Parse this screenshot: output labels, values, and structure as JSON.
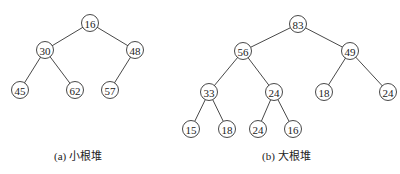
{
  "figure": {
    "left": {
      "caption": "(a) 小根堆",
      "nodes": [
        {
          "id": "a0",
          "value": "16",
          "x": 90,
          "y": 23
        },
        {
          "id": "a1",
          "value": "30",
          "x": 45,
          "y": 50
        },
        {
          "id": "a2",
          "value": "48",
          "x": 135,
          "y": 50
        },
        {
          "id": "a3",
          "value": "45",
          "x": 20,
          "y": 90
        },
        {
          "id": "a4",
          "value": "62",
          "x": 75,
          "y": 90
        },
        {
          "id": "a5",
          "value": "57",
          "x": 110,
          "y": 90
        }
      ],
      "edges": [
        [
          "a0",
          "a1"
        ],
        [
          "a0",
          "a2"
        ],
        [
          "a1",
          "a3"
        ],
        [
          "a1",
          "a4"
        ],
        [
          "a2",
          "a5"
        ]
      ]
    },
    "right": {
      "caption": "(b) 大根堆",
      "nodes": [
        {
          "id": "b0",
          "value": "83",
          "x": 298,
          "y": 24
        },
        {
          "id": "b1",
          "value": "56",
          "x": 243,
          "y": 51
        },
        {
          "id": "b2",
          "value": "49",
          "x": 350,
          "y": 51
        },
        {
          "id": "b3",
          "value": "33",
          "x": 209,
          "y": 92
        },
        {
          "id": "b4",
          "value": "24",
          "x": 274,
          "y": 92
        },
        {
          "id": "b5",
          "value": "18",
          "x": 324,
          "y": 92
        },
        {
          "id": "b6",
          "value": "24",
          "x": 388,
          "y": 92
        },
        {
          "id": "b7",
          "value": "15",
          "x": 191,
          "y": 129
        },
        {
          "id": "b8",
          "value": "18",
          "x": 227,
          "y": 129
        },
        {
          "id": "b9",
          "value": "24",
          "x": 258,
          "y": 129
        },
        {
          "id": "b10",
          "value": "16",
          "x": 293,
          "y": 129
        }
      ],
      "edges": [
        [
          "b0",
          "b1"
        ],
        [
          "b0",
          "b2"
        ],
        [
          "b1",
          "b3"
        ],
        [
          "b1",
          "b4"
        ],
        [
          "b2",
          "b5"
        ],
        [
          "b2",
          "b6"
        ],
        [
          "b3",
          "b7"
        ],
        [
          "b3",
          "b8"
        ],
        [
          "b4",
          "b9"
        ],
        [
          "b4",
          "b10"
        ]
      ]
    }
  }
}
